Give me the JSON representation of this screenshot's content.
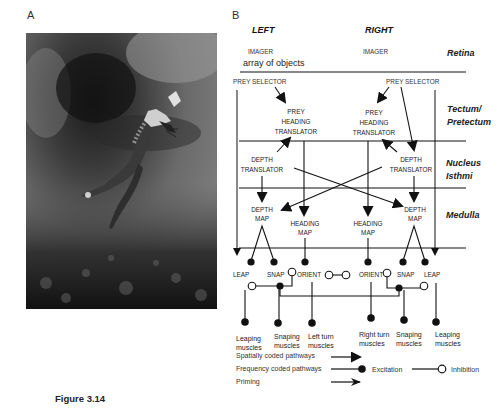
{
  "figure": {
    "caption": "Figure 3.14",
    "panel_a_label": "A",
    "panel_b_label": "B"
  },
  "photo": {
    "description": "photograph of a leaping frog catching prey in mid-air"
  },
  "diagram": {
    "top": {
      "left_title": "LEFT",
      "right_title": "RIGHT",
      "left_imager": "IMAGER",
      "right_imager": "IMAGER",
      "array_label": "array of objects"
    },
    "regions": {
      "retina": "Retina",
      "tectum": "Tectum/",
      "pretectum": "Pretectum",
      "nucleus": "Nucleus",
      "isthmi": "Isthmi",
      "medulla": "Medulla"
    },
    "nodes": {
      "prey_selector_left": "PREY SELECTOR",
      "prey_selector_right": "PREY SELECTOR",
      "prey_heading_left": [
        "PREY",
        "HEADING",
        "TRANSLATOR"
      ],
      "prey_heading_right": [
        "PREY",
        "HEADING",
        "TRANSLATOR"
      ],
      "depth_translator_left": [
        "DEPTH",
        "TRANSLATOR"
      ],
      "depth_translator_right": [
        "DEPTH",
        "TRANSLATOR"
      ],
      "depth_map_left": [
        "DEPTH",
        "MAP"
      ],
      "depth_map_right": [
        "DEPTH",
        "MAP"
      ],
      "heading_map_left": [
        "HEADING",
        "MAP"
      ],
      "heading_map_right": [
        "HEADING",
        "MAP"
      ]
    },
    "motor": {
      "leap_left": "LEAP",
      "snap_left": "SNAP",
      "orient_left": "ORIENT",
      "orient_right": "ORIENT",
      "snap_right": "SNAP",
      "leap_right": "LEAP"
    },
    "muscles": [
      [
        "Leaping",
        "muscles"
      ],
      [
        "Snaping",
        "muscles"
      ],
      [
        "Left turn",
        "muscles"
      ],
      [
        "Right turn",
        "muscles"
      ],
      [
        "Snaping",
        "muscles"
      ],
      [
        "Leaping",
        "muscles"
      ]
    ],
    "legend": {
      "spatial": "Spatially coded pathways",
      "frequency": "Frequency coded pathways",
      "priming": "Priming",
      "excitation": "Excitation",
      "inhibition": "Inhibition"
    }
  }
}
